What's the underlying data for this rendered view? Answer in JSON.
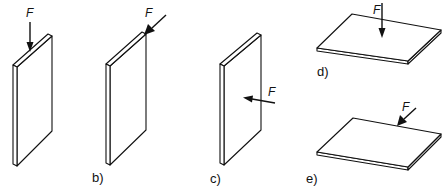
{
  "figure": {
    "type": "plate loading cases diagram",
    "stroke_color": "#111111",
    "background": "#ffffff",
    "panels": [
      {
        "id": "a",
        "label": "",
        "orientation": "vertical",
        "force_label": "F",
        "force_direction": "downward along top edge (in-plane)"
      },
      {
        "id": "b",
        "label": "b)",
        "orientation": "vertical",
        "force_label": "F",
        "force_direction": "in-plane along top edge, diagonal"
      },
      {
        "id": "c",
        "label": "c)",
        "orientation": "vertical",
        "force_label": "F",
        "force_direction": "perpendicular to plate face"
      },
      {
        "id": "d",
        "label": "d)",
        "orientation": "horizontal",
        "force_label": "F",
        "force_direction": "downward onto plate face"
      },
      {
        "id": "e",
        "label": "e)",
        "orientation": "horizontal",
        "force_label": "F",
        "force_direction": "on back edge, in-plane"
      }
    ]
  }
}
